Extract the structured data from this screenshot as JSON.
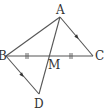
{
  "diagram": {
    "type": "geometry",
    "points": [
      {
        "name": "A",
        "x": 60,
        "y": 17,
        "label_x": 56,
        "label_y": 14
      },
      {
        "name": "B",
        "x": 6,
        "y": 56,
        "label_x": -2,
        "label_y": 60
      },
      {
        "name": "C",
        "x": 93,
        "y": 56,
        "label_x": 95,
        "label_y": 60
      },
      {
        "name": "M",
        "x": 50,
        "y": 56,
        "label_x": 48,
        "label_y": 69
      },
      {
        "name": "D",
        "x": 39,
        "y": 94,
        "label_x": 34,
        "label_y": 108
      }
    ],
    "segments": [
      "AB",
      "AC",
      "BC",
      "AD",
      "BD"
    ],
    "equal_marks": {
      "segments": [
        "BM",
        "MC"
      ],
      "style": "double-tick"
    },
    "parallel_marks": {
      "segments": [
        "AC",
        "BD"
      ],
      "style": "arrow"
    },
    "colors": {
      "line": "#555555",
      "text": "#333333",
      "background": "#ffffff"
    }
  },
  "labels": {
    "A": "A",
    "B": "B",
    "C": "C",
    "M": "M",
    "D": "D"
  }
}
